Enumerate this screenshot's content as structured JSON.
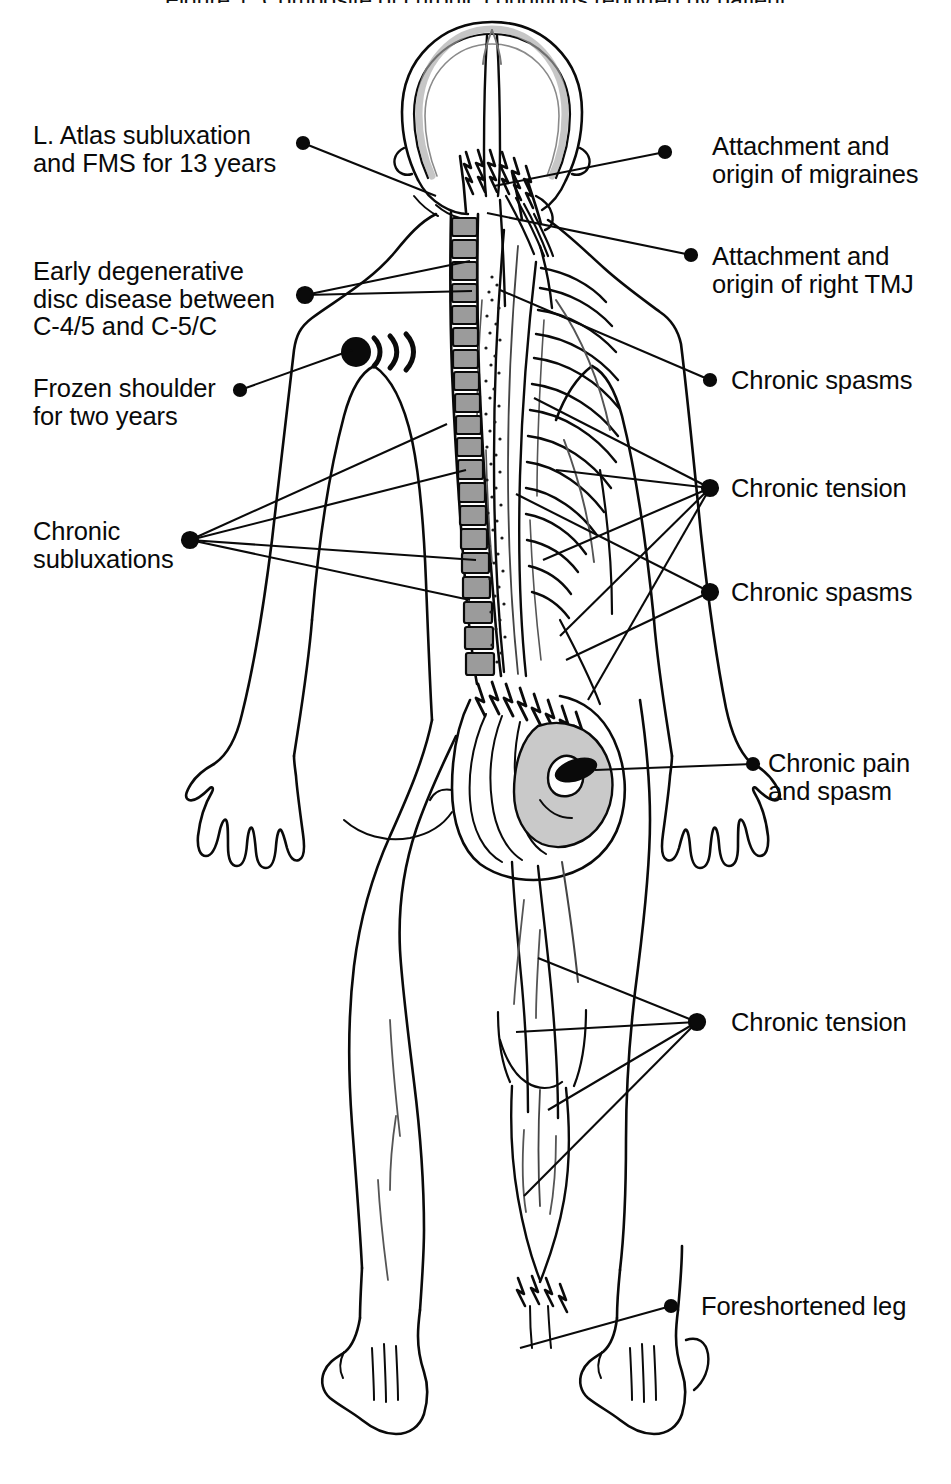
{
  "page": {
    "width": 951,
    "height": 1484,
    "background_color": "#ffffff",
    "ink_color": "#0a0a0a",
    "shade_gray": "#b3b3b3",
    "shade_light": "#d8d8d8",
    "partial_top_caption": "Figure 1. Composite of chronic conditions reported by patient"
  },
  "figure": {
    "name": "posterior-anatomical-body-diagram"
  },
  "annotations": {
    "left": [
      {
        "id": "atlas-subluxation",
        "lines": [
          "L. Atlas subluxation",
          "and FMS for 13 years"
        ],
        "text_x": 33,
        "text_y": 122,
        "dot_x": 303,
        "dot_y": 143,
        "leaders": [
          [
            303,
            143,
            436,
            196
          ]
        ]
      },
      {
        "id": "degenerative-disc-disease",
        "lines": [
          "Early degenerative",
          "disc disease between",
          "C-4/5 and C-5/C"
        ],
        "text_x": 33,
        "text_y": 258,
        "dot_x": 305,
        "dot_y": 295,
        "leaders": [
          [
            305,
            295,
            470,
            261
          ],
          [
            305,
            295,
            472,
            291
          ]
        ]
      },
      {
        "id": "frozen-shoulder",
        "lines": [
          "Frozen shoulder",
          "for two years"
        ],
        "text_x": 33,
        "text_y": 375,
        "dot_x": 240,
        "dot_y": 390,
        "leaders": [
          [
            240,
            390,
            352,
            350
          ]
        ]
      },
      {
        "id": "chronic-subluxations",
        "lines": [
          "Chronic",
          "subluxations"
        ],
        "text_x": 33,
        "text_y": 518,
        "dot_x": 190,
        "dot_y": 540,
        "leaders": [
          [
            190,
            540,
            447,
            424
          ],
          [
            190,
            540,
            466,
            470
          ],
          [
            190,
            540,
            476,
            560
          ],
          [
            190,
            540,
            470,
            600
          ]
        ]
      }
    ],
    "right": [
      {
        "id": "migraines",
        "lines": [
          "Attachment and",
          "origin of migraines"
        ],
        "text_x": 712,
        "text_y": 133,
        "dot_x": 665,
        "dot_y": 152,
        "leaders": [
          [
            665,
            152,
            494,
            186
          ]
        ]
      },
      {
        "id": "right-tmj",
        "lines": [
          "Attachment and",
          "origin of right TMJ"
        ],
        "text_x": 712,
        "text_y": 243,
        "dot_x": 691,
        "dot_y": 255,
        "leaders": [
          [
            691,
            255,
            487,
            213
          ]
        ]
      },
      {
        "id": "chronic-spasms-upper",
        "lines": [
          "Chronic spasms"
        ],
        "text_x": 731,
        "text_y": 367,
        "dot_x": 710,
        "dot_y": 380,
        "leaders": [
          [
            710,
            380,
            500,
            290
          ]
        ]
      },
      {
        "id": "chronic-tension-trunk",
        "lines": [
          "Chronic tension"
        ],
        "text_x": 731,
        "text_y": 475,
        "dot_x": 710,
        "dot_y": 488,
        "leaders": [
          [
            710,
            488,
            534,
            398
          ],
          [
            710,
            488,
            556,
            470
          ],
          [
            710,
            488,
            543,
            560
          ],
          [
            710,
            488,
            560,
            636
          ],
          [
            710,
            488,
            588,
            700
          ]
        ]
      },
      {
        "id": "chronic-spasms-lower",
        "lines": [
          "Chronic spasms"
        ],
        "text_x": 731,
        "text_y": 579,
        "dot_x": 710,
        "dot_y": 592,
        "leaders": [
          [
            710,
            592,
            516,
            494
          ],
          [
            710,
            592,
            566,
            660
          ]
        ]
      },
      {
        "id": "chronic-pain-and-spasm",
        "lines": [
          "Chronic pain",
          "and spasm"
        ],
        "text_x": 768,
        "text_y": 750,
        "dot_x": 753,
        "dot_y": 764,
        "leaders": [
          [
            753,
            764,
            595,
            770
          ]
        ]
      },
      {
        "id": "chronic-tension-leg",
        "lines": [
          "Chronic tension"
        ],
        "text_x": 731,
        "text_y": 1009,
        "dot_x": 697,
        "dot_y": 1022,
        "leaders": [
          [
            697,
            1022,
            538,
            958
          ],
          [
            697,
            1022,
            516,
            1032
          ],
          [
            697,
            1022,
            548,
            1110
          ],
          [
            697,
            1022,
            524,
            1196
          ]
        ]
      },
      {
        "id": "foreshortened-leg",
        "lines": [
          "Foreshortened leg"
        ],
        "text_x": 701,
        "text_y": 1293,
        "dot_x": 671,
        "dot_y": 1306,
        "leaders": [
          [
            671,
            1306,
            520,
            1348
          ]
        ]
      }
    ]
  },
  "markers": {
    "shoulder_pain_radiation": {
      "name": "pain-radiation-marker",
      "x": 356,
      "y": 352,
      "radius": 15,
      "arc_count": 3
    },
    "gluteal_trigger_point": {
      "name": "trigger-point-marker",
      "x": 576,
      "y": 770
    }
  }
}
